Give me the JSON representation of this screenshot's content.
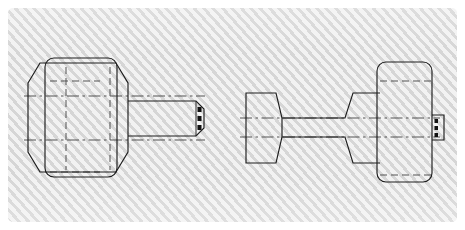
{
  "document": {
    "title": "Mechanical Part Orthographic Drawing",
    "sheet_label": "drawing-sheet",
    "background_style": "diagonal-hatch",
    "colors": {
      "sheet_light": "#f2f2f2",
      "sheet_hatch": "#d6d6d6",
      "page_margin": "#ffffff",
      "line_color": "#1d1d1d",
      "hidden_line_color": "#4a4a4a",
      "center_line_color": "#4a4a4a"
    }
  },
  "views": [
    {
      "id": "view-left",
      "name": "front-end-view",
      "label": "Front / End View",
      "description": "Hex flange seen across flats with rounded-rectangle body overlay and stepped threaded shaft extending to the right",
      "features": [
        {
          "name": "hex-flange-outline",
          "type": "hexagon"
        },
        {
          "name": "body-rounded-rectangle",
          "type": "rounded-rect"
        },
        {
          "name": "shaft-step",
          "type": "polyline"
        },
        {
          "name": "threaded-tip",
          "type": "chamfered-end"
        },
        {
          "name": "horizontal-centerline-upper",
          "type": "center-line"
        },
        {
          "name": "horizontal-centerline-lower",
          "type": "center-line"
        },
        {
          "name": "vertical-hidden-line-left",
          "type": "hidden-line"
        },
        {
          "name": "vertical-hidden-line-right",
          "type": "hidden-line"
        }
      ],
      "thread_tick_count": 3
    },
    {
      "id": "view-right",
      "name": "side-profile-view",
      "label": "Side Profile View",
      "description": "Trapezoidal head at left, tapered shank in the middle, large rounded-rectangle flange at right, small threaded stub protruding right",
      "features": [
        {
          "name": "head-trapezoid",
          "type": "trapezoid"
        },
        {
          "name": "shank-taper",
          "type": "polyline"
        },
        {
          "name": "flange-rounded-rectangle",
          "type": "rounded-rect"
        },
        {
          "name": "threaded-stub",
          "type": "rect"
        },
        {
          "name": "horizontal-centerline-upper",
          "type": "center-line"
        },
        {
          "name": "horizontal-centerline-lower",
          "type": "center-line"
        }
      ],
      "thread_tick_count": 3
    }
  ]
}
